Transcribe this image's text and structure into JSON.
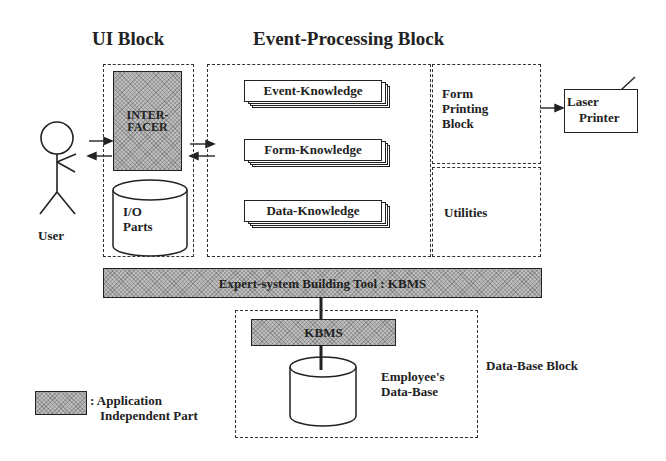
{
  "titles": {
    "ui_block": "UI Block",
    "event_processing_block": "Event-Processing Block"
  },
  "actor": {
    "label": "User"
  },
  "ui_block": {
    "interfacer": {
      "line1": "INTER-",
      "line2": "FACER"
    },
    "io_parts": {
      "line1": "I/O",
      "line2": "Parts"
    }
  },
  "event_processing": {
    "knowledge": [
      {
        "label": "Event-Knowledge"
      },
      {
        "label": "Form-Knowledge"
      },
      {
        "label": "Data-Knowledge"
      }
    ]
  },
  "form_printing_block": {
    "line1": "Form",
    "line2": "Printing",
    "line3": "Block"
  },
  "utilities": {
    "label": "Utilities"
  },
  "laser_printer": {
    "line1": "Laser",
    "line2": "Printer"
  },
  "kbms_tool": {
    "label": "Expert-system Building Tool : KBMS"
  },
  "database_block": {
    "label": "Data-Base Block",
    "kbms": {
      "label": "KBMS"
    },
    "db": {
      "line1": "Employee's",
      "line2": "Data-Base"
    }
  },
  "legend": {
    "line1": ": Application",
    "line2": "Independent Part"
  },
  "colors": {
    "shaded_fill": "#bdbdbd",
    "line": "#222222"
  }
}
